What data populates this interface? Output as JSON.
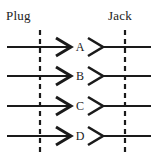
{
  "diagram": {
    "type": "connector-pinout",
    "title_left": "Plug",
    "title_right": "Jack",
    "background_color": "#ffffff",
    "line_color": "#1a1a1a",
    "rows": [
      {
        "letter": "A",
        "y": 47
      },
      {
        "letter": "B",
        "y": 76
      },
      {
        "letter": "C",
        "y": 106
      },
      {
        "letter": "D",
        "y": 136
      }
    ],
    "dashed_lines": [
      {
        "name": "plug-boundary",
        "x": 40,
        "y_top": 30,
        "y_bottom": 152
      },
      {
        "name": "jack-boundary",
        "x": 125,
        "y_top": 30,
        "y_bottom": 152
      }
    ],
    "geometry": {
      "left_line_start_x": 7,
      "left_line_end_x": 56,
      "plug_arrow_start_x": 56,
      "plug_arrow_tip_x": 71,
      "jack_contact_start_x": 88,
      "jack_contact_tip_x": 103,
      "right_line_start_x": 103,
      "right_line_end_x": 151,
      "arrow_half_height": 9,
      "stroke_width": 2.2,
      "dash_pattern": "5,4"
    }
  }
}
